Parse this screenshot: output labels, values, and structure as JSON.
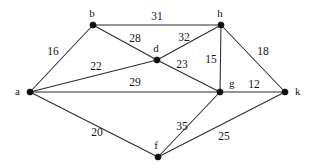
{
  "figure": {
    "background_color": "#ffffff",
    "edge_color": "#2b2b2b",
    "node_color": "#101010",
    "label_color": "#141414",
    "width": 313,
    "height": 168
  },
  "chart_data": {
    "type": "diagram",
    "subtype": "undirected-weighted-graph",
    "title": "",
    "xlabel": "",
    "ylabel": "",
    "grid": false,
    "legend": false,
    "node_count": 7,
    "edge_count": 13,
    "nodes": [
      {
        "id": "a",
        "label": "a",
        "x": 30,
        "y": 92,
        "label_dx": -10,
        "label_dy": 0
      },
      {
        "id": "b",
        "label": "b",
        "x": 93,
        "y": 25,
        "label_dx": -1,
        "label_dy": -11
      },
      {
        "id": "d",
        "label": "d",
        "x": 157,
        "y": 60,
        "label_dx": -1,
        "label_dy": -11
      },
      {
        "id": "f",
        "label": "f",
        "x": 158,
        "y": 157,
        "label_dx": -2,
        "label_dy": -11
      },
      {
        "id": "g",
        "label": "g",
        "x": 220,
        "y": 92,
        "label_dx": 9,
        "label_dy": -8
      },
      {
        "id": "h",
        "label": "h",
        "x": 221,
        "y": 25,
        "label_dx": -1,
        "label_dy": -11
      },
      {
        "id": "k",
        "label": "k",
        "x": 285,
        "y": 92,
        "label_dx": 10,
        "label_dy": 0
      }
    ],
    "edges": [
      {
        "source": "a",
        "target": "b",
        "weight": 16,
        "label_x": 53,
        "label_y": 52
      },
      {
        "source": "a",
        "target": "d",
        "weight": 22,
        "label_x": 96,
        "label_y": 67
      },
      {
        "source": "a",
        "target": "g",
        "weight": 29,
        "label_x": 135,
        "label_y": 83
      },
      {
        "source": "a",
        "target": "f",
        "weight": 20,
        "label_x": 97,
        "label_y": 133
      },
      {
        "source": "b",
        "target": "h",
        "weight": 31,
        "label_x": 157,
        "label_y": 17
      },
      {
        "source": "b",
        "target": "d",
        "weight": 28,
        "label_x": 135,
        "label_y": 39
      },
      {
        "source": "d",
        "target": "h",
        "weight": 32,
        "label_x": 184,
        "label_y": 38
      },
      {
        "source": "d",
        "target": "g",
        "weight": 23,
        "label_x": 182,
        "label_y": 65
      },
      {
        "source": "g",
        "target": "h",
        "weight": 15,
        "label_x": 211,
        "label_y": 60
      },
      {
        "source": "h",
        "target": "k",
        "weight": 18,
        "label_x": 263,
        "label_y": 52
      },
      {
        "source": "g",
        "target": "k",
        "weight": 12,
        "label_x": 254,
        "label_y": 85
      },
      {
        "source": "g",
        "target": "f",
        "weight": 35,
        "label_x": 182,
        "label_y": 127
      },
      {
        "source": "f",
        "target": "k",
        "weight": 25,
        "label_x": 224,
        "label_y": 137
      }
    ],
    "node_ids": [
      "a",
      "b",
      "d",
      "f",
      "g",
      "h",
      "k"
    ],
    "weights": [
      16,
      22,
      29,
      20,
      31,
      28,
      32,
      23,
      15,
      18,
      12,
      35,
      25
    ],
    "edge_pairs": [
      "a-b",
      "a-d",
      "a-g",
      "a-f",
      "b-h",
      "b-d",
      "d-h",
      "d-g",
      "g-h",
      "h-k",
      "g-k",
      "g-f",
      "f-k"
    ]
  }
}
